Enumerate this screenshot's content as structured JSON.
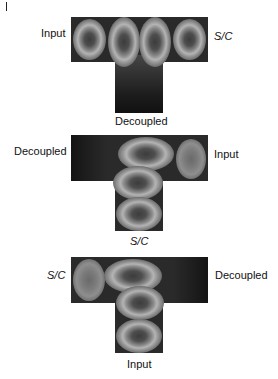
{
  "figure": {
    "panels": [
      {
        "id": "panel-1",
        "labels": {
          "left": "Input",
          "right": "S/C",
          "bottom": "Decoupled"
        },
        "left_italic": false,
        "right_italic": true,
        "bottom_italic": false,
        "modes": 4
      },
      {
        "id": "panel-2",
        "labels": {
          "left": "Decoupled",
          "right": "Input",
          "bottom": "S/C"
        },
        "left_italic": false,
        "right_italic": false,
        "bottom_italic": true,
        "modes": 4
      },
      {
        "id": "panel-3",
        "labels": {
          "left": "S/C",
          "right": "Decoupled",
          "bottom": "Input"
        },
        "left_italic": true,
        "right_italic": false,
        "bottom_italic": false,
        "modes": 4
      }
    ]
  }
}
